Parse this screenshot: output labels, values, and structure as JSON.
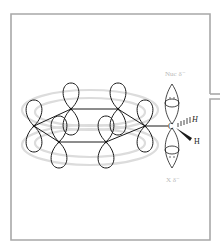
{
  "diagram": {
    "labels": {
      "nucleophile": "Nuc δ⁻",
      "leaving_group": "X δ⁻",
      "carbon": "C",
      "hydrogen_hashed": "H",
      "hydrogen_wedge": "H"
    },
    "colors": {
      "frame": "#a8a8a8",
      "bonds": "#1a1a1a",
      "orbital_outline": "#1a1a1a",
      "pi_cloud": "#d9d9d9",
      "faint_labels": "#b8b8b8"
    },
    "ring_atoms": 6,
    "orbital_lone_pair_dots": "••"
  }
}
